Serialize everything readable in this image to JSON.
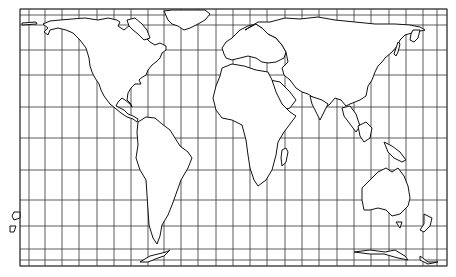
{
  "map": {
    "type": "world outline map",
    "projection_style": "equal-area cylindrical with graticule",
    "colors": {
      "land_fill": "#ffffff",
      "coastline": "#111111",
      "grid": "#333333",
      "background": "#ffffff"
    },
    "frame": {
      "left": 20,
      "top": 9,
      "right": 447,
      "bottom": 266
    },
    "grid": {
      "meridians_x": [
        20,
        29,
        45,
        62,
        79,
        97,
        114,
        131,
        148,
        164,
        181,
        198,
        216,
        233,
        250,
        267,
        285,
        302,
        319,
        337,
        354,
        371,
        389,
        406,
        423,
        437,
        447
      ],
      "parallels_y": [
        9,
        15,
        25,
        50,
        75,
        107,
        138,
        170,
        200,
        226,
        249,
        260,
        266
      ]
    },
    "regions": [
      {
        "name": "North America"
      },
      {
        "name": "Greenland"
      },
      {
        "name": "South America"
      },
      {
        "name": "Europe"
      },
      {
        "name": "Africa"
      },
      {
        "name": "Asia"
      },
      {
        "name": "Madagascar"
      },
      {
        "name": "Australia"
      },
      {
        "name": "New Zealand"
      },
      {
        "name": "Antarctica"
      }
    ]
  }
}
